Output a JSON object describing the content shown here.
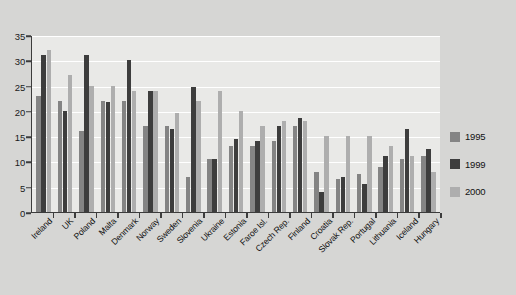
{
  "chart_data": {
    "type": "bar",
    "title": "",
    "xlabel": "",
    "ylabel": "",
    "ylim": [
      0,
      35
    ],
    "yticks": [
      0,
      5,
      10,
      15,
      20,
      25,
      30,
      35
    ],
    "grid": true,
    "legend_position": "right",
    "categories": [
      "Ireland",
      "UK",
      "Poland",
      "Malta",
      "Denmark",
      "Norway",
      "Sweden",
      "Slovenia",
      "Ukraine",
      "Estonia",
      "Faroe Isl.",
      "Czech Rep.",
      "Finland",
      "Croatia",
      "Slovak Rep.",
      "Portugal",
      "Lithuania",
      "Iceland",
      "Hungary"
    ],
    "series": [
      {
        "name": "1995",
        "color": "#848484",
        "values": [
          23,
          22,
          16,
          22,
          22,
          17,
          17,
          7,
          10.5,
          13,
          13,
          14,
          17,
          8,
          6.5,
          7.5,
          9,
          10.5,
          11
        ]
      },
      {
        "name": "1999",
        "color": "#3d3d3d",
        "values": [
          31,
          20,
          31,
          21.8,
          30,
          24,
          16.5,
          24.8,
          10.5,
          14.5,
          14,
          17,
          18.5,
          4,
          7,
          5.5,
          11,
          16.5,
          12.5
        ]
      },
      {
        "name": "2000",
        "color": "#aeaeae",
        "values": [
          32,
          27,
          25,
          25,
          24,
          24,
          19.5,
          22,
          24,
          20,
          17,
          18,
          18,
          15,
          15,
          15,
          13,
          11,
          8
        ]
      }
    ]
  },
  "legend": {
    "entries": [
      {
        "label": "1995",
        "color": "#848484"
      },
      {
        "label": "1999",
        "color": "#3d3d3d"
      },
      {
        "label": "2000",
        "color": "#aeaeae"
      }
    ]
  }
}
